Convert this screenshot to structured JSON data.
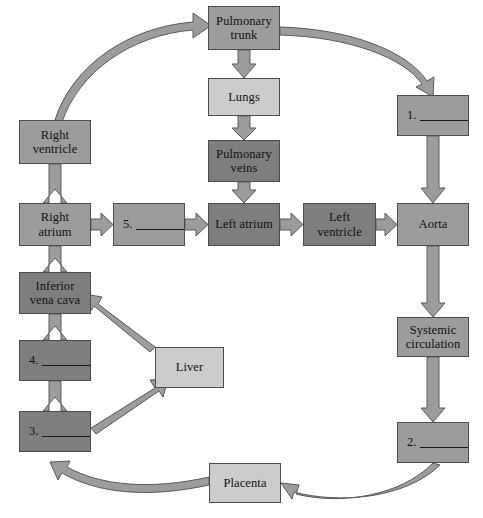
{
  "diagram": {
    "palette": {
      "light": "#cccccc",
      "medium": "#9c9c9c",
      "dark": "#7e7e7e",
      "outline": "#4d4d4d",
      "arrow_fill": "#9c9c9c",
      "arrow_stroke": "#5a5a5a",
      "background": "#ffffff",
      "text": "#111111"
    },
    "nodes": [
      {
        "id": "pulmonary-trunk",
        "label": "Pulmonary trunk",
        "shade": "medium",
        "x": 208,
        "y": 6,
        "w": 72,
        "h": 44
      },
      {
        "id": "lungs",
        "label": "Lungs",
        "shade": "light",
        "x": 208,
        "y": 78,
        "w": 72,
        "h": 38
      },
      {
        "id": "pulmonary-veins",
        "label": "Pulmonary veins",
        "shade": "dark",
        "x": 208,
        "y": 140,
        "w": 72,
        "h": 42
      },
      {
        "id": "left-atrium",
        "label": "Left atrium",
        "shade": "dark",
        "x": 208,
        "y": 203,
        "w": 72,
        "h": 43
      },
      {
        "id": "left-ventricle",
        "label": "Left ventricle",
        "shade": "dark",
        "x": 303,
        "y": 203,
        "w": 73,
        "h": 43
      },
      {
        "id": "aorta",
        "label": "Aorta",
        "shade": "medium",
        "x": 397,
        "y": 203,
        "w": 72,
        "h": 43
      },
      {
        "id": "systemic-circulation",
        "label": "Systemic circulation",
        "shade": "medium",
        "x": 397,
        "y": 317,
        "w": 72,
        "h": 40
      },
      {
        "id": "right-ventricle",
        "label": "Right ventricle",
        "shade": "medium",
        "x": 19,
        "y": 120,
        "w": 72,
        "h": 44
      },
      {
        "id": "right-atrium",
        "label": "Right atrium",
        "shade": "medium",
        "x": 19,
        "y": 203,
        "w": 72,
        "h": 43
      },
      {
        "id": "inferior-vena-cava",
        "label": "Inferior vena cava",
        "shade": "dark",
        "x": 19,
        "y": 272,
        "w": 72,
        "h": 42
      },
      {
        "id": "liver",
        "label": "Liver",
        "shade": "light",
        "x": 155,
        "y": 347,
        "w": 69,
        "h": 41
      },
      {
        "id": "placenta",
        "label": "Placenta",
        "shade": "light",
        "x": 209,
        "y": 463,
        "w": 72,
        "h": 40
      }
    ],
    "blank_nodes": [
      {
        "id": "blank-1",
        "number": "1.",
        "shade": "medium",
        "x": 397,
        "y": 95,
        "w": 72,
        "h": 41
      },
      {
        "id": "blank-2",
        "number": "2.",
        "shade": "medium",
        "x": 397,
        "y": 422,
        "w": 72,
        "h": 41
      },
      {
        "id": "blank-3",
        "number": "3.",
        "shade": "dark",
        "x": 19,
        "y": 411,
        "w": 72,
        "h": 41
      },
      {
        "id": "blank-4",
        "number": "4.",
        "shade": "dark",
        "x": 19,
        "y": 340,
        "w": 72,
        "h": 41
      },
      {
        "id": "blank-5",
        "number": "5.",
        "shade": "medium",
        "x": 113,
        "y": 203,
        "w": 72,
        "h": 43
      }
    ],
    "connections": [
      {
        "from": "right-ventricle",
        "to": "pulmonary-trunk",
        "style": "curved"
      },
      {
        "from": "pulmonary-trunk",
        "to": "blank-1",
        "style": "curved"
      },
      {
        "from": "pulmonary-trunk",
        "to": "lungs",
        "style": "straight-down"
      },
      {
        "from": "lungs",
        "to": "pulmonary-veins",
        "style": "straight-down"
      },
      {
        "from": "pulmonary-veins",
        "to": "left-atrium",
        "style": "straight-down"
      },
      {
        "from": "blank-5",
        "to": "left-atrium",
        "style": "straight-right"
      },
      {
        "from": "right-atrium",
        "to": "blank-5",
        "style": "straight-right"
      },
      {
        "from": "left-atrium",
        "to": "left-ventricle",
        "style": "straight-right"
      },
      {
        "from": "left-ventricle",
        "to": "aorta",
        "style": "straight-right"
      },
      {
        "from": "blank-1",
        "to": "aorta",
        "style": "straight-down"
      },
      {
        "from": "aorta",
        "to": "systemic-circulation",
        "style": "straight-down"
      },
      {
        "from": "systemic-circulation",
        "to": "blank-2",
        "style": "straight-down"
      },
      {
        "from": "blank-2",
        "to": "placenta",
        "style": "curved"
      },
      {
        "from": "placenta",
        "to": "blank-3",
        "style": "curved"
      },
      {
        "from": "blank-3",
        "to": "liver",
        "style": "diagonal"
      },
      {
        "from": "liver",
        "to": "inferior-vena-cava",
        "style": "diagonal"
      },
      {
        "from": "blank-3",
        "to": "blank-4",
        "style": "straight-up"
      },
      {
        "from": "blank-4",
        "to": "inferior-vena-cava",
        "style": "straight-up"
      },
      {
        "from": "inferior-vena-cava",
        "to": "right-atrium",
        "style": "straight-up"
      },
      {
        "from": "right-atrium",
        "to": "right-ventricle",
        "style": "straight-up"
      }
    ]
  }
}
